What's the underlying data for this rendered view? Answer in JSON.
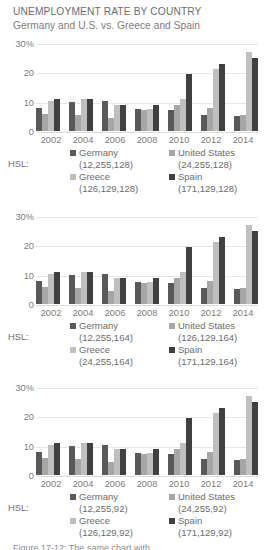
{
  "header": {
    "title": "UNEMPLOYMENT RATE BY COUNTRY",
    "subtitle": "Germany and U.S. vs. Greece and Spain"
  },
  "hsl_label": "HSL:",
  "caption": "Figure 17-12: The same chart with",
  "chart_data": {
    "type": "bar",
    "title": "UNEMPLOYMENT RATE BY COUNTRY",
    "subtitle": "Germany and U.S. vs. Greece and Spain",
    "xlabel": "",
    "ylabel": "",
    "ylim": [
      0,
      30
    ],
    "yticks": [
      "0",
      "10",
      "20",
      "30%"
    ],
    "grid": true,
    "legend_position": "bottom",
    "categories": [
      "2002",
      "2004",
      "2006",
      "2008",
      "2010",
      "2012",
      "2014"
    ],
    "series": [
      {
        "name": "Germany",
        "values": [
          8.0,
          10.0,
          10.3,
          7.5,
          7.0,
          5.5,
          5.0
        ]
      },
      {
        "name": "United States",
        "values": [
          5.8,
          5.5,
          4.6,
          7.0,
          9.0,
          8.0,
          5.3
        ]
      },
      {
        "name": "Greece",
        "values": [
          10.3,
          10.8,
          9.0,
          7.5,
          11.0,
          21.0,
          27.0
        ]
      },
      {
        "name": "Spain",
        "values": [
          10.8,
          11.0,
          8.7,
          8.7,
          19.3,
          23.0,
          25.0
        ]
      }
    ]
  },
  "charts": [
    {
      "yticks": [
        "30%",
        "20",
        "10",
        "0"
      ],
      "xlabels": [
        "2002",
        "2004",
        "2006",
        "2008",
        "2010",
        "2012",
        "2014"
      ],
      "hsl_label": "HSL:",
      "legend": [
        {
          "name": "Germany",
          "hsl": "(12,255,128)",
          "color": "#595959"
        },
        {
          "name": "United States",
          "hsl": "(24,255,128)",
          "color": "#a6a6a6"
        },
        {
          "name": "Greece",
          "hsl": "(126,129,128)",
          "color": "#bfbfbf"
        },
        {
          "name": "Spain",
          "hsl": "(171,129,128)",
          "color": "#404040"
        }
      ]
    },
    {
      "yticks": [
        "30%",
        "20",
        "10",
        "0"
      ],
      "xlabels": [
        "2002",
        "2004",
        "2006",
        "2008",
        "2010",
        "2012",
        "2014"
      ],
      "hsl_label": "HSL:",
      "legend": [
        {
          "name": "Germany",
          "hsl": "(12,255,164)",
          "color": "#595959"
        },
        {
          "name": "United States",
          "hsl": "(126,129,164)",
          "color": "#a6a6a6"
        },
        {
          "name": "Greece",
          "hsl": "(24,255,164)",
          "color": "#bfbfbf"
        },
        {
          "name": "Spain",
          "hsl": "(171,129,164)",
          "color": "#404040"
        }
      ]
    },
    {
      "yticks": [
        "30%",
        "20",
        "10",
        "0"
      ],
      "xlabels": [
        "2002",
        "2004",
        "2006",
        "2008",
        "2010",
        "2012",
        "2014"
      ],
      "hsl_label": "HSL:",
      "legend": [
        {
          "name": "Germany",
          "hsl": "(12,255,92)",
          "color": "#595959"
        },
        {
          "name": "United States",
          "hsl": "(24,255,92)",
          "color": "#a6a6a6"
        },
        {
          "name": "Greece",
          "hsl": "(126,129,92)",
          "color": "#bfbfbf"
        },
        {
          "name": "Spain",
          "hsl": "(171,129,92)",
          "color": "#404040"
        }
      ]
    }
  ]
}
